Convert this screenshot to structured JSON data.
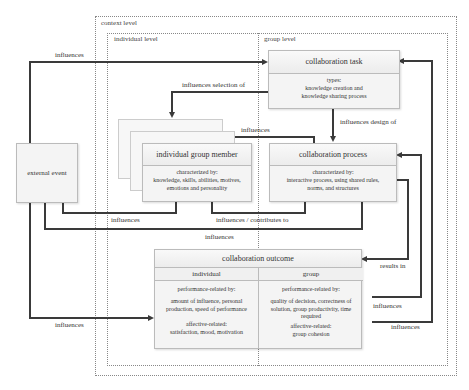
{
  "frames": {
    "context": "context level",
    "individual": "individual level",
    "group": "group level"
  },
  "boxes": {
    "external_event": {
      "title": "external event"
    },
    "collaboration_task": {
      "title": "collaboration task",
      "body_line1": "types:",
      "body_line2": "knowledge creation and",
      "body_line3": "knowledge sharing process"
    },
    "individual_group_member": {
      "title": "individual group member",
      "body_line1": "characterized by:",
      "body_line2": "knowledge, skills, abilities, motives,",
      "body_line3": "emotions and personality"
    },
    "collaboration_process": {
      "title": "collaboration process",
      "body_line1": "characterized by:",
      "body_line2": "interactive process, using shared rules,",
      "body_line3": "norms, and structures"
    },
    "collaboration_outcome": {
      "title": "collaboration outcome",
      "individual": {
        "header": "individual",
        "perf_label": "performance-related by:",
        "perf_text": "amount of influence, personal production, speed of performance",
        "affect_label": "affective-related:",
        "affect_text": "satisfaction, mood, motivation"
      },
      "group": {
        "header": "group",
        "perf_label": "performance-related by:",
        "perf_text": "quality of decision, correctness of solution, group productivity, time required",
        "affect_label": "affective-related:",
        "affect_text": "group cohesion"
      }
    }
  },
  "edge_labels": {
    "ext_to_task": "influences",
    "task_to_member": "influences selection of",
    "process_to_member": "influences",
    "task_to_process": "influences design of",
    "ext_to_member": "influences",
    "member_to_process": "influences / contributes to",
    "ext_to_process": "influences",
    "process_to_outcome": "results in",
    "outcome_to_process": "influences",
    "outcome_to_task": "influences",
    "ext_to_outcome": "influences"
  }
}
